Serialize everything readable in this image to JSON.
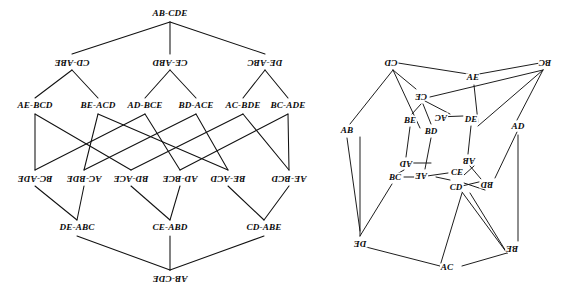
{
  "figure": {
    "title": ""
  },
  "colors": {
    "stroke": "#111111",
    "background": "#ffffff",
    "text": "#0b0b0b"
  },
  "lattice": {
    "name": "split-lattice-diagram",
    "rows": [
      {
        "row": 0,
        "flipped": false,
        "nodes": [
          {
            "label": "AB-CDE",
            "x": 170,
            "y": 14
          }
        ]
      },
      {
        "row": 1,
        "flipped": true,
        "nodes": [
          {
            "label": "CD-ABE",
            "x": 72,
            "y": 62
          },
          {
            "label": "CE-ABD",
            "x": 170,
            "y": 62
          },
          {
            "label": "DE-ABC",
            "x": 265,
            "y": 62
          }
        ]
      },
      {
        "row": 2,
        "flipped": false,
        "nodes": [
          {
            "label": "AE-BCD",
            "x": 35,
            "y": 106
          },
          {
            "label": "BE-ACD",
            "x": 98,
            "y": 106
          },
          {
            "label": "AD-BCE",
            "x": 145,
            "y": 106
          },
          {
            "label": "BD-ACE",
            "x": 196,
            "y": 106
          },
          {
            "label": "AC-BDE",
            "x": 243,
            "y": 106
          },
          {
            "label": "BC-ADE",
            "x": 288,
            "y": 106
          }
        ]
      },
      {
        "row": 3,
        "flipped": true,
        "nodes": [
          {
            "label": "BC-ADE",
            "x": 35,
            "y": 178
          },
          {
            "label": "AC-BDE",
            "x": 84,
            "y": 178
          },
          {
            "label": "BD-ACE",
            "x": 131,
            "y": 178
          },
          {
            "label": "AD-BCE",
            "x": 180,
            "y": 178
          },
          {
            "label": "BE-ACD",
            "x": 228,
            "y": 178
          },
          {
            "label": "AE-BCD",
            "x": 289,
            "y": 178
          }
        ]
      },
      {
        "row": 4,
        "flipped": false,
        "nodes": [
          {
            "label": "DE-ABC",
            "x": 77,
            "y": 228
          },
          {
            "label": "CE-ABD",
            "x": 170,
            "y": 228
          },
          {
            "label": "CD-ABE",
            "x": 264,
            "y": 228
          }
        ]
      },
      {
        "row": 5,
        "flipped": true,
        "nodes": [
          {
            "label": "AB-CDE",
            "x": 170,
            "y": 278
          }
        ]
      }
    ],
    "edges": [
      [
        170,
        22,
        72,
        54
      ],
      [
        170,
        22,
        170,
        54
      ],
      [
        170,
        22,
        265,
        54
      ],
      [
        72,
        70,
        35,
        98
      ],
      [
        72,
        70,
        98,
        98
      ],
      [
        170,
        70,
        145,
        98
      ],
      [
        170,
        70,
        196,
        98
      ],
      [
        265,
        70,
        243,
        98
      ],
      [
        265,
        70,
        288,
        98
      ],
      [
        35,
        114,
        35,
        170
      ],
      [
        35,
        114,
        131,
        170
      ],
      [
        98,
        114,
        84,
        170
      ],
      [
        98,
        114,
        228,
        170
      ],
      [
        145,
        114,
        35,
        170
      ],
      [
        145,
        114,
        180,
        170
      ],
      [
        196,
        114,
        84,
        170
      ],
      [
        196,
        114,
        228,
        170
      ],
      [
        243,
        114,
        131,
        170
      ],
      [
        243,
        114,
        289,
        170
      ],
      [
        288,
        114,
        180,
        170
      ],
      [
        288,
        114,
        289,
        170
      ],
      [
        35,
        186,
        77,
        220
      ],
      [
        84,
        186,
        77,
        220
      ],
      [
        131,
        186,
        170,
        220
      ],
      [
        180,
        186,
        170,
        220
      ],
      [
        228,
        186,
        264,
        220
      ],
      [
        289,
        186,
        264,
        220
      ],
      [
        77,
        236,
        170,
        270
      ],
      [
        170,
        236,
        170,
        270
      ],
      [
        264,
        236,
        170,
        270
      ]
    ]
  },
  "petersen": {
    "name": "petersen-graph-diagram",
    "outer_nodes": [
      {
        "label": "CD",
        "x": 391,
        "y": 62,
        "flipped": true
      },
      {
        "label": "BC",
        "x": 545,
        "y": 62,
        "flipped": true
      },
      {
        "label": "AD",
        "x": 518,
        "y": 127,
        "flipped": false
      },
      {
        "label": "BE",
        "x": 512,
        "y": 248,
        "flipped": true
      },
      {
        "label": "AC",
        "x": 447,
        "y": 268,
        "flipped": false
      },
      {
        "label": "DE",
        "x": 360,
        "y": 243,
        "flipped": true
      },
      {
        "label": "AB",
        "x": 347,
        "y": 131,
        "flipped": false
      },
      {
        "label": "AE",
        "x": 473,
        "y": 78,
        "flipped": false
      }
    ],
    "inner_nodes": [
      {
        "label": "CE",
        "x": 421,
        "y": 96,
        "flipped": true
      },
      {
        "label": "AC",
        "x": 441,
        "y": 117,
        "flipped": true
      },
      {
        "label": "DE",
        "x": 471,
        "y": 119,
        "flipped": false
      },
      {
        "label": "BE",
        "x": 410,
        "y": 120,
        "flipped": false
      },
      {
        "label": "BD",
        "x": 431,
        "y": 131,
        "flipped": false
      },
      {
        "label": "AD",
        "x": 406,
        "y": 163,
        "flipped": true
      },
      {
        "label": "AB",
        "x": 469,
        "y": 160,
        "flipped": true
      },
      {
        "label": "CE",
        "x": 457,
        "y": 172,
        "flipped": false
      },
      {
        "label": "BC",
        "x": 395,
        "y": 177,
        "flipped": false
      },
      {
        "label": "AE",
        "x": 421,
        "y": 175,
        "flipped": true
      },
      {
        "label": "CD",
        "x": 456,
        "y": 187,
        "flipped": false
      },
      {
        "label": "BD",
        "x": 487,
        "y": 184,
        "flipped": true
      }
    ],
    "edges": [
      [
        393,
        70,
        350,
        124
      ],
      [
        393,
        70,
        416,
        89
      ],
      [
        393,
        70,
        420,
        128
      ],
      [
        398,
        63,
        468,
        74
      ],
      [
        479,
        74,
        540,
        63
      ],
      [
        543,
        70,
        517,
        120
      ],
      [
        543,
        70,
        478,
        126
      ],
      [
        543,
        70,
        430,
        97
      ],
      [
        474,
        85,
        478,
        122
      ],
      [
        518,
        135,
        518,
        241
      ],
      [
        517,
        132,
        495,
        178
      ],
      [
        507,
        253,
        462,
        266
      ],
      [
        507,
        253,
        470,
        193
      ],
      [
        507,
        253,
        462,
        192
      ],
      [
        440,
        266,
        366,
        247
      ],
      [
        440,
        266,
        462,
        193
      ],
      [
        360,
        236,
        360,
        137
      ],
      [
        360,
        236,
        392,
        184
      ],
      [
        347,
        138,
        360,
        231
      ],
      [
        421,
        104,
        412,
        114
      ],
      [
        423,
        104,
        431,
        124
      ],
      [
        425,
        101,
        450,
        114
      ],
      [
        410,
        127,
        406,
        157
      ],
      [
        431,
        138,
        425,
        169
      ],
      [
        471,
        126,
        468,
        154
      ],
      [
        437,
        117,
        463,
        116
      ],
      [
        413,
        163,
        431,
        163
      ],
      [
        404,
        170,
        397,
        174
      ],
      [
        404,
        177,
        415,
        177
      ],
      [
        427,
        176,
        448,
        173
      ],
      [
        464,
        175,
        474,
        166
      ],
      [
        470,
        166,
        481,
        179
      ],
      [
        462,
        186,
        483,
        181
      ],
      [
        464,
        183,
        485,
        190
      ],
      [
        450,
        180,
        436,
        177
      ]
    ]
  }
}
